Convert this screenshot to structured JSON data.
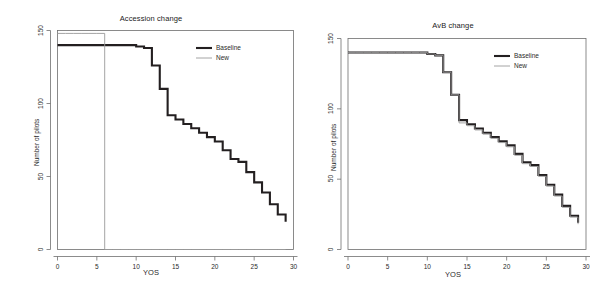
{
  "figure": {
    "background": "#ffffff",
    "panel_count": 2
  },
  "chart_data": [
    {
      "type": "line",
      "subtype": "step",
      "title": "Accession change",
      "xlabel": "YOS",
      "ylabel": "Number of pilots",
      "xlim": [
        0,
        30
      ],
      "ylim": [
        0,
        150
      ],
      "xticks": [
        0,
        5,
        10,
        15,
        20,
        25,
        30
      ],
      "xtick_labels": [
        "0",
        "5",
        "10",
        "15",
        "20",
        "25",
        "30"
      ],
      "yticks": [
        0,
        50,
        100,
        150
      ],
      "ytick_labels": [
        "0",
        "50",
        "100",
        "150"
      ],
      "grid": false,
      "legend": {
        "position": "top-right",
        "entries": [
          {
            "name": "Baseline",
            "color": "#231f20",
            "width": 2.1
          },
          {
            "name": "New",
            "color": "#9a9a9a",
            "width": 0.9
          }
        ]
      },
      "series": [
        {
          "name": "Baseline",
          "color": "#231f20",
          "width": 2.1,
          "x": [
            0,
            1,
            2,
            3,
            4,
            5,
            6,
            7,
            8,
            9,
            10,
            11,
            12,
            13,
            14,
            15,
            16,
            17,
            18,
            19,
            20,
            21,
            22,
            23,
            24,
            25,
            26,
            27,
            28,
            29
          ],
          "y": [
            140,
            140,
            140,
            140,
            140,
            140,
            140,
            140,
            140,
            140,
            139,
            138,
            126,
            110,
            92,
            89,
            86,
            83,
            80,
            77,
            74,
            68,
            62,
            60,
            53,
            46,
            39,
            31,
            24,
            19
          ]
        },
        {
          "name": "New",
          "color": "#9a9a9a",
          "width": 0.9,
          "x": [
            0,
            1,
            2,
            3,
            4,
            5,
            6,
            7,
            8,
            9,
            10,
            11,
            12,
            13,
            14,
            15,
            16,
            17,
            18,
            19,
            20,
            21,
            22,
            23,
            24,
            25,
            26,
            27,
            28,
            29
          ],
          "y": [
            148,
            148,
            148,
            148,
            148,
            148,
            0,
            0,
            0,
            0,
            0,
            0,
            0,
            0,
            0,
            0,
            0,
            0,
            0,
            0,
            0,
            0,
            0,
            0,
            0,
            0,
            0,
            0,
            0,
            0
          ]
        }
      ]
    },
    {
      "type": "line",
      "subtype": "step",
      "title": "AvB change",
      "xlabel": "YOS",
      "ylabel": "Number of pilots",
      "xlim": [
        0,
        30
      ],
      "ylim": [
        0,
        150
      ],
      "xticks": [
        0,
        5,
        10,
        15,
        20,
        25,
        30
      ],
      "xtick_labels": [
        "0",
        "5",
        "10",
        "15",
        "20",
        "25",
        "30"
      ],
      "yticks": [
        0,
        50,
        100,
        150
      ],
      "ytick_labels": [
        "0",
        "50",
        "100",
        "150"
      ],
      "grid": false,
      "legend": {
        "position": "top-right",
        "entries": [
          {
            "name": "Baseline",
            "color": "#231f20",
            "width": 2.1
          },
          {
            "name": "New",
            "color": "#9a9a9a",
            "width": 0.9
          }
        ]
      },
      "series": [
        {
          "name": "Baseline",
          "color": "#231f20",
          "width": 2.1,
          "x": [
            0,
            1,
            2,
            3,
            4,
            5,
            6,
            7,
            8,
            9,
            10,
            11,
            12,
            13,
            14,
            15,
            16,
            17,
            18,
            19,
            20,
            21,
            22,
            23,
            24,
            25,
            26,
            27,
            28,
            29
          ],
          "y": [
            140,
            140,
            140,
            140,
            140,
            140,
            140,
            140,
            140,
            140,
            139,
            138,
            126,
            110,
            92,
            89,
            86,
            83,
            80,
            77,
            74,
            68,
            62,
            60,
            53,
            46,
            39,
            31,
            24,
            19
          ]
        },
        {
          "name": "New",
          "color": "#9a9a9a",
          "width": 0.9,
          "x": [
            0,
            1,
            2,
            3,
            4,
            5,
            6,
            7,
            8,
            9,
            10,
            11,
            12,
            13,
            14,
            15,
            16,
            17,
            18,
            19,
            20,
            21,
            22,
            23,
            24,
            25,
            26,
            27,
            28,
            29
          ],
          "y": [
            140,
            140,
            140,
            140,
            140,
            140,
            140,
            140,
            140,
            140,
            139,
            138,
            126,
            110,
            90,
            88,
            85,
            82,
            79,
            76,
            73,
            67,
            61,
            59,
            52,
            45,
            38,
            30,
            23,
            18
          ]
        }
      ]
    }
  ]
}
